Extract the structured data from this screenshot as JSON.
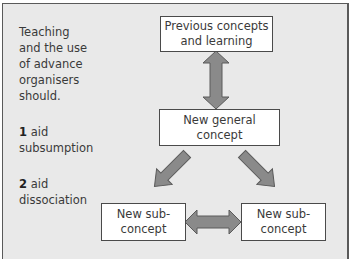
{
  "sidebar_text": {
    "intro_lines": [
      "Teaching",
      "and the use",
      "of advance",
      "organisers",
      "should."
    ],
    "points": [
      {
        "number": "1",
        "text_first": "aid",
        "text_second": "subsumption"
      },
      {
        "number": "2",
        "text_first": "aid",
        "text_second": "dissociation"
      }
    ]
  },
  "nodes": {
    "previous": {
      "line1": "Previous concepts",
      "line2": "and learning"
    },
    "general": {
      "line1": "New general",
      "line2": "concept"
    },
    "sub_left": {
      "line1": "New sub-",
      "line2": "concept"
    },
    "sub_right": {
      "line1": "New sub-",
      "line2": "concept"
    }
  },
  "edges": [
    {
      "from": "previous",
      "to": "general",
      "type": "bidirectional"
    },
    {
      "from": "general",
      "to": "sub_left",
      "type": "directed"
    },
    {
      "from": "general",
      "to": "sub_right",
      "type": "directed"
    },
    {
      "from": "sub_left",
      "to": "sub_right",
      "type": "bidirectional"
    }
  ],
  "colors": {
    "background": "#e9e9e9",
    "arrow_fill": "#8a8a8a",
    "arrow_stroke": "#5a5a5a",
    "box_fill": "#ffffff",
    "box_border": "#4a4a4a"
  }
}
